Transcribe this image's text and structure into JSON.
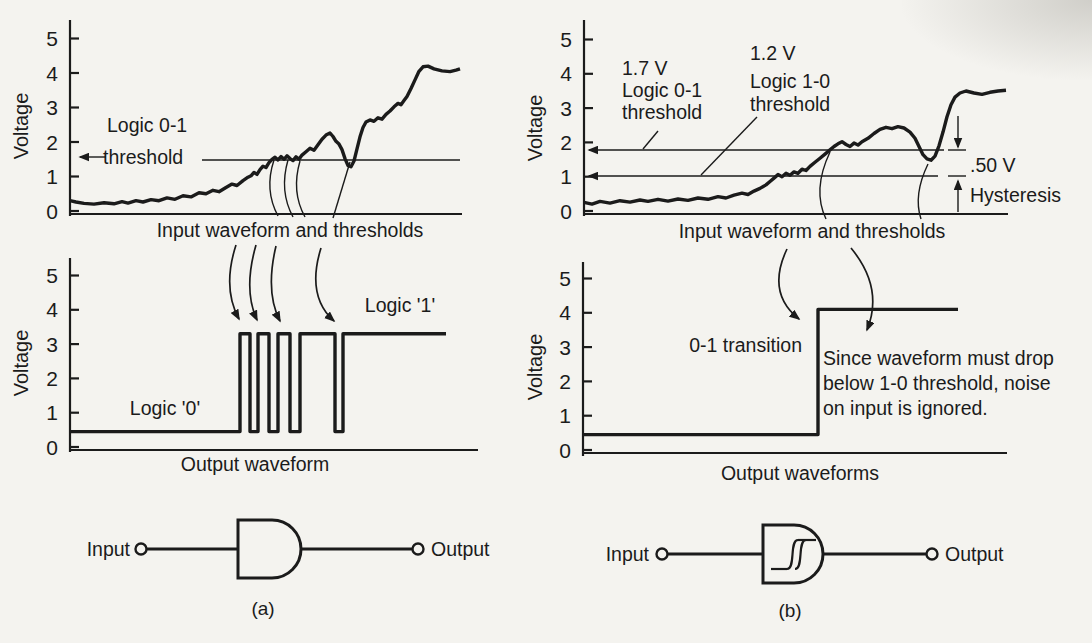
{
  "figure": {
    "background": "#f4f3ef",
    "ink": "#1b1b1b",
    "axis": {
      "ylabel": "Voltage",
      "ticks": [
        "0",
        "1",
        "2",
        "3",
        "4",
        "5"
      ]
    }
  },
  "panel_a": {
    "caption": "(a)",
    "input_plot": {
      "type": "line",
      "xlabel": "Input waveform and thresholds",
      "threshold": {
        "label_line1": "Logic 0-1",
        "label_line2": "threshold",
        "volts": 1.5
      },
      "waveform_volts": [
        [
          0,
          0.3
        ],
        [
          6,
          0.26
        ],
        [
          14,
          0.22
        ],
        [
          24,
          0.2
        ],
        [
          34,
          0.24
        ],
        [
          44,
          0.21
        ],
        [
          52,
          0.27
        ],
        [
          58,
          0.23
        ],
        [
          66,
          0.3
        ],
        [
          73,
          0.26
        ],
        [
          81,
          0.33
        ],
        [
          89,
          0.3
        ],
        [
          97,
          0.38
        ],
        [
          105,
          0.34
        ],
        [
          113,
          0.44
        ],
        [
          121,
          0.41
        ],
        [
          129,
          0.53
        ],
        [
          136,
          0.5
        ],
        [
          143,
          0.6
        ],
        [
          149,
          0.56
        ],
        [
          156,
          0.68
        ],
        [
          162,
          0.78
        ],
        [
          167,
          0.74
        ],
        [
          173,
          0.88
        ],
        [
          178,
          0.98
        ],
        [
          181,
          1.02
        ],
        [
          184,
          1.12
        ],
        [
          187,
          1.06
        ],
        [
          190,
          1.2
        ],
        [
          193,
          1.3
        ],
        [
          196,
          1.26
        ],
        [
          199,
          1.4
        ],
        [
          202,
          1.5
        ],
        [
          205,
          1.56
        ],
        [
          208,
          1.48
        ],
        [
          211,
          1.58
        ],
        [
          214,
          1.5
        ],
        [
          217,
          1.6
        ],
        [
          220,
          1.52
        ],
        [
          223,
          1.46
        ],
        [
          226,
          1.57
        ],
        [
          229,
          1.5
        ],
        [
          232,
          1.62
        ],
        [
          236,
          1.72
        ],
        [
          240,
          1.82
        ],
        [
          244,
          1.76
        ],
        [
          248,
          1.92
        ],
        [
          252,
          2.08
        ],
        [
          256,
          2.2
        ],
        [
          260,
          2.26
        ],
        [
          263,
          2.16
        ],
        [
          266,
          2.02
        ],
        [
          269,
          1.94
        ],
        [
          272,
          1.78
        ],
        [
          275,
          1.52
        ],
        [
          278,
          1.32
        ],
        [
          281,
          1.28
        ],
        [
          284,
          1.45
        ],
        [
          287,
          1.8
        ],
        [
          290,
          2.15
        ],
        [
          293,
          2.42
        ],
        [
          296,
          2.58
        ],
        [
          300,
          2.64
        ],
        [
          304,
          2.6
        ],
        [
          308,
          2.7
        ],
        [
          312,
          2.66
        ],
        [
          316,
          2.8
        ],
        [
          320,
          2.9
        ],
        [
          324,
          3.02
        ],
        [
          328,
          3.12
        ],
        [
          331,
          3.08
        ],
        [
          334,
          3.2
        ],
        [
          337,
          3.32
        ],
        [
          341,
          3.55
        ],
        [
          345,
          3.8
        ],
        [
          349,
          4.05
        ],
        [
          353,
          4.18
        ],
        [
          358,
          4.2
        ],
        [
          364,
          4.12
        ],
        [
          372,
          4.06
        ],
        [
          380,
          4.04
        ],
        [
          386,
          4.08
        ],
        [
          390,
          4.12
        ]
      ]
    },
    "output_plot": {
      "type": "line",
      "xlabel": "Output waveform",
      "logic0_label": "Logic '0'",
      "logic1_label": "Logic '1'",
      "low_volts": 0.45,
      "high_volts": 3.3,
      "waveform_volts": [
        [
          0,
          0.45
        ],
        [
          170,
          0.45
        ],
        [
          170,
          3.3
        ],
        [
          180,
          3.3
        ],
        [
          180,
          0.45
        ],
        [
          188,
          0.45
        ],
        [
          188,
          3.3
        ],
        [
          199,
          3.3
        ],
        [
          199,
          0.45
        ],
        [
          208,
          0.45
        ],
        [
          208,
          3.3
        ],
        [
          220,
          3.3
        ],
        [
          220,
          0.45
        ],
        [
          230,
          0.45
        ],
        [
          230,
          3.3
        ],
        [
          265,
          3.3
        ],
        [
          265,
          0.45
        ],
        [
          273,
          0.45
        ],
        [
          273,
          3.3
        ],
        [
          376,
          3.3
        ]
      ]
    },
    "gate": {
      "input_label": "Input",
      "output_label": "Output"
    }
  },
  "panel_b": {
    "caption": "(b)",
    "input_plot": {
      "type": "line",
      "xlabel": "Input waveform and thresholds",
      "upper_threshold": {
        "label_line1": "1.7 V",
        "label_line2": "Logic 0-1",
        "label_line3": "threshold",
        "volts": 1.7
      },
      "lower_threshold": {
        "label_line1": "1.2 V",
        "label_line2": "Logic 1-0",
        "label_line3": "threshold",
        "volts": 1.2
      },
      "hysteresis": {
        "value": ".50 V",
        "label": "Hysteresis"
      },
      "waveform_volts": [
        [
          0,
          0.25
        ],
        [
          8,
          0.2
        ],
        [
          16,
          0.28
        ],
        [
          26,
          0.23
        ],
        [
          36,
          0.3
        ],
        [
          46,
          0.26
        ],
        [
          56,
          0.32
        ],
        [
          64,
          0.28
        ],
        [
          74,
          0.34
        ],
        [
          84,
          0.29
        ],
        [
          94,
          0.35
        ],
        [
          104,
          0.31
        ],
        [
          114,
          0.38
        ],
        [
          124,
          0.34
        ],
        [
          134,
          0.42
        ],
        [
          142,
          0.38
        ],
        [
          150,
          0.46
        ],
        [
          158,
          0.52
        ],
        [
          164,
          0.48
        ],
        [
          170,
          0.58
        ],
        [
          176,
          0.66
        ],
        [
          182,
          0.76
        ],
        [
          186,
          0.86
        ],
        [
          190,
          0.96
        ],
        [
          194,
          1.06
        ],
        [
          198,
          1.0
        ],
        [
          202,
          1.1
        ],
        [
          206,
          1.04
        ],
        [
          210,
          1.14
        ],
        [
          214,
          1.1
        ],
        [
          218,
          1.22
        ],
        [
          222,
          1.18
        ],
        [
          226,
          1.3
        ],
        [
          231,
          1.42
        ],
        [
          236,
          1.54
        ],
        [
          241,
          1.66
        ],
        [
          246,
          1.78
        ],
        [
          250,
          1.88
        ],
        [
          254,
          1.96
        ],
        [
          258,
          2.02
        ],
        [
          262,
          1.94
        ],
        [
          266,
          1.88
        ],
        [
          270,
          1.98
        ],
        [
          274,
          1.92
        ],
        [
          278,
          2.02
        ],
        [
          284,
          2.12
        ],
        [
          290,
          2.26
        ],
        [
          296,
          2.38
        ],
        [
          302,
          2.44
        ],
        [
          308,
          2.4
        ],
        [
          314,
          2.46
        ],
        [
          320,
          2.42
        ],
        [
          326,
          2.3
        ],
        [
          331,
          2.12
        ],
        [
          335,
          1.88
        ],
        [
          339,
          1.64
        ],
        [
          343,
          1.52
        ],
        [
          347,
          1.48
        ],
        [
          351,
          1.6
        ],
        [
          355,
          1.9
        ],
        [
          359,
          2.3
        ],
        [
          363,
          2.75
        ],
        [
          367,
          3.1
        ],
        [
          371,
          3.32
        ],
        [
          376,
          3.44
        ],
        [
          382,
          3.5
        ],
        [
          390,
          3.44
        ],
        [
          398,
          3.4
        ],
        [
          406,
          3.46
        ],
        [
          414,
          3.5
        ],
        [
          422,
          3.52
        ]
      ]
    },
    "output_plot": {
      "type": "line",
      "xlabel": "Output waveforms",
      "transition_label": "0-1 transition",
      "note_line1": "Since waveform must drop",
      "note_line2": "below 1-0 threshold, noise",
      "note_line3": "on input is ignored.",
      "low_volts": 0.45,
      "high_volts": 4.1,
      "waveform_volts": [
        [
          0,
          0.45
        ],
        [
          235,
          0.45
        ],
        [
          235,
          4.1
        ],
        [
          375,
          4.1
        ]
      ]
    },
    "gate": {
      "input_label": "Input",
      "output_label": "Output"
    }
  }
}
